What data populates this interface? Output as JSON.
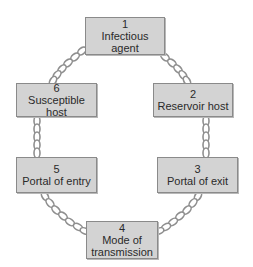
{
  "links": [
    {
      "number": "1",
      "line1": "Infectious",
      "line2": "agent"
    },
    {
      "number": "2",
      "line1": "Reservoir host",
      "line2": ""
    },
    {
      "number": "3",
      "line1": "Portal of exit",
      "line2": ""
    },
    {
      "number": "4",
      "line1": "Mode of",
      "line2": "transmission"
    },
    {
      "number": "5",
      "line1": "Portal of entry",
      "line2": ""
    },
    {
      "number": "6",
      "line1": "Susceptible host",
      "line2": ""
    }
  ],
  "colors": {
    "box_fill": "#d3d3d3",
    "box_border": "#8a8a8a",
    "chain": "#9a9a9a",
    "text": "#2a2a2a"
  }
}
